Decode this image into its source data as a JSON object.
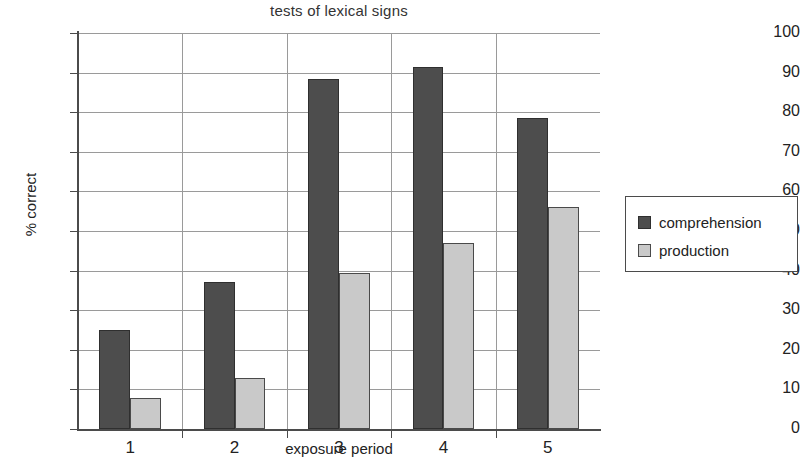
{
  "chart_data": {
    "type": "bar",
    "title": "tests of lexical signs",
    "xlabel": "exposure period",
    "ylabel": "% correct",
    "categories": [
      "1",
      "2",
      "3",
      "4",
      "5"
    ],
    "series": [
      {
        "name": "comprehension",
        "color": "#4d4d4d",
        "values": [
          25,
          37,
          88.5,
          91.5,
          78.5
        ]
      },
      {
        "name": "production",
        "color": "#c9c9c9",
        "values": [
          7.8,
          13,
          39.5,
          47,
          56
        ]
      }
    ],
    "ylim": [
      0,
      100
    ],
    "ytick_labels": [
      "100",
      "90",
      "80",
      "70",
      "60",
      "50",
      "40",
      "30",
      "20",
      "10",
      "0"
    ],
    "ytick_values": [
      100,
      90,
      80,
      70,
      60,
      50,
      40,
      30,
      20,
      10,
      0
    ],
    "grid": true,
    "grid_axis": "both",
    "legend_position": "right",
    "legend_entries": [
      "comprehension",
      "production"
    ]
  }
}
